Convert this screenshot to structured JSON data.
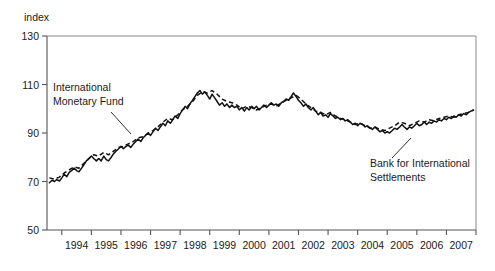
{
  "chart_data": {
    "type": "line",
    "title": "",
    "subtitle": "",
    "ylabel": "index",
    "xlabel": "",
    "ylim": [
      50,
      130
    ],
    "yticks": [
      50,
      70,
      90,
      110,
      130
    ],
    "ytick_labels": [
      "50",
      "70",
      "90",
      "110",
      "130"
    ],
    "xlim": [
      1993.5,
      2008.0
    ],
    "xticks": [
      1994,
      1995,
      1996,
      1997,
      1998,
      1999,
      2000,
      2001,
      2002,
      2003,
      2004,
      2005,
      2006,
      2007,
      2008
    ],
    "xtick_labels": [
      "1994",
      "1995",
      "1996",
      "1997",
      "1998",
      "1999",
      "2000",
      "2001",
      "2002",
      "2003",
      "2004",
      "2005",
      "2006",
      "2007"
    ],
    "grid": false,
    "legend_position": "inline-annotations",
    "annotations": [
      {
        "name": "imf-annotation",
        "lines": [
          "International",
          "Monetary Fund"
        ],
        "text_x": 53,
        "text_y": 91,
        "leader": {
          "x1": 111,
          "y1": 112,
          "x2": 131,
          "y2": 134
        }
      },
      {
        "name": "bis-annotation",
        "lines": [
          "Bank for International",
          "Settlements"
        ],
        "text_x": 370,
        "text_y": 167,
        "leader": {
          "x1": 392,
          "y1": 158,
          "x2": 411,
          "y2": 138
        }
      }
    ],
    "series": [
      {
        "name": "International Monetary Fund",
        "style": "dashed",
        "x": [
          1993.58,
          1993.75,
          1993.92,
          1994.08,
          1994.25,
          1994.42,
          1994.58,
          1994.75,
          1994.92,
          1995.08,
          1995.25,
          1995.42,
          1995.58,
          1995.75,
          1995.92,
          1996.08,
          1996.25,
          1996.42,
          1996.58,
          1996.75,
          1996.92,
          1997.08,
          1997.25,
          1997.42,
          1997.58,
          1997.75,
          1997.92,
          1998.08,
          1998.25,
          1998.42,
          1998.58,
          1998.75,
          1998.92,
          1999.08,
          1999.25,
          1999.42,
          1999.58,
          1999.75,
          1999.92,
          2000.08,
          2000.25,
          2000.42,
          2000.58,
          2000.75,
          2000.92,
          2001.08,
          2001.25,
          2001.42,
          2001.58,
          2001.75,
          2001.92,
          2002.08,
          2002.25,
          2002.42,
          2002.58,
          2002.75,
          2002.92,
          2003.08,
          2003.25,
          2003.42,
          2003.58,
          2003.75,
          2003.92,
          2004.08,
          2004.25,
          2004.42,
          2004.58,
          2004.75,
          2004.92,
          2005.08,
          2005.25,
          2005.42,
          2005.58,
          2005.75,
          2005.92,
          2006.08,
          2006.25,
          2006.42,
          2006.58,
          2006.75,
          2006.92,
          2007.08,
          2007.25,
          2007.42,
          2007.58,
          2007.75,
          2007.92
        ],
        "y": [
          71.5,
          71.0,
          71.8,
          73.5,
          74.8,
          76.0,
          75.5,
          77.5,
          79.5,
          81.0,
          80.5,
          82.0,
          81.0,
          82.5,
          84.0,
          84.5,
          85.5,
          86.5,
          88.0,
          88.5,
          90.0,
          91.0,
          92.5,
          94.5,
          96.0,
          95.5,
          97.5,
          99.5,
          101.0,
          103.0,
          105.5,
          107.0,
          106.5,
          107.5,
          106.0,
          104.0,
          103.0,
          102.5,
          101.5,
          100.0,
          101.0,
          100.5,
          99.5,
          100.5,
          101.5,
          102.0,
          101.0,
          102.5,
          103.5,
          104.5,
          105.5,
          104.0,
          102.0,
          100.5,
          99.0,
          98.5,
          97.5,
          98.5,
          97.0,
          96.0,
          95.5,
          94.5,
          93.5,
          94.0,
          93.0,
          92.0,
          92.5,
          91.5,
          91.0,
          92.0,
          93.0,
          94.5,
          94.0,
          93.0,
          94.0,
          95.0,
          94.5,
          95.5,
          95.0,
          96.0,
          96.5,
          97.0,
          96.5,
          97.5,
          98.0,
          98.5,
          99.5
        ]
      },
      {
        "name": "Bank for International Settlements",
        "style": "solid",
        "x": [
          1993.58,
          1993.67,
          1993.75,
          1993.83,
          1993.92,
          1994.0,
          1994.08,
          1994.17,
          1994.25,
          1994.33,
          1994.42,
          1994.5,
          1994.58,
          1994.67,
          1994.75,
          1994.83,
          1994.92,
          1995.0,
          1995.08,
          1995.17,
          1995.25,
          1995.33,
          1995.42,
          1995.5,
          1995.58,
          1995.67,
          1995.75,
          1995.83,
          1995.92,
          1996.0,
          1996.08,
          1996.17,
          1996.25,
          1996.33,
          1996.42,
          1996.5,
          1996.58,
          1996.67,
          1996.75,
          1996.83,
          1996.92,
          1997.0,
          1997.08,
          1997.17,
          1997.25,
          1997.33,
          1997.42,
          1997.5,
          1997.58,
          1997.67,
          1997.75,
          1997.83,
          1997.92,
          1998.0,
          1998.08,
          1998.17,
          1998.25,
          1998.33,
          1998.42,
          1998.5,
          1998.58,
          1998.67,
          1998.75,
          1998.83,
          1998.92,
          1999.0,
          1999.08,
          1999.17,
          1999.25,
          1999.33,
          1999.42,
          1999.5,
          1999.58,
          1999.67,
          1999.75,
          1999.83,
          1999.92,
          2000.0,
          2000.08,
          2000.17,
          2000.25,
          2000.33,
          2000.42,
          2000.5,
          2000.58,
          2000.67,
          2000.75,
          2000.83,
          2000.92,
          2001.0,
          2001.08,
          2001.17,
          2001.25,
          2001.33,
          2001.42,
          2001.5,
          2001.58,
          2001.67,
          2001.75,
          2001.83,
          2001.92,
          2002.0,
          2002.08,
          2002.17,
          2002.25,
          2002.33,
          2002.42,
          2002.5,
          2002.58,
          2002.67,
          2002.75,
          2002.83,
          2002.92,
          2003.0,
          2003.08,
          2003.17,
          2003.25,
          2003.33,
          2003.42,
          2003.5,
          2003.58,
          2003.67,
          2003.75,
          2003.83,
          2003.92,
          2004.0,
          2004.08,
          2004.17,
          2004.25,
          2004.33,
          2004.42,
          2004.5,
          2004.58,
          2004.67,
          2004.75,
          2004.83,
          2004.92,
          2005.0,
          2005.08,
          2005.17,
          2005.25,
          2005.33,
          2005.42,
          2005.5,
          2005.58,
          2005.67,
          2005.75,
          2005.83,
          2005.92,
          2006.0,
          2006.08,
          2006.17,
          2006.25,
          2006.33,
          2006.42,
          2006.5,
          2006.58,
          2006.67,
          2006.75,
          2006.83,
          2006.92,
          2007.0,
          2007.08,
          2007.17,
          2007.25,
          2007.33,
          2007.42,
          2007.5,
          2007.58,
          2007.67,
          2007.75,
          2007.83,
          2007.92
        ],
        "y": [
          69.5,
          70.5,
          70.0,
          70.8,
          70.2,
          71.5,
          73.0,
          72.0,
          73.8,
          74.5,
          75.5,
          74.5,
          74.0,
          75.5,
          77.0,
          78.5,
          79.5,
          80.5,
          79.5,
          78.5,
          79.5,
          78.5,
          80.5,
          79.0,
          78.5,
          80.0,
          81.5,
          82.5,
          83.5,
          84.5,
          83.5,
          84.5,
          85.0,
          84.0,
          85.5,
          86.5,
          87.5,
          86.5,
          88.0,
          89.0,
          90.0,
          89.0,
          90.5,
          92.0,
          91.0,
          92.5,
          94.0,
          93.0,
          95.0,
          94.0,
          95.5,
          97.0,
          96.0,
          98.0,
          99.5,
          101.0,
          100.0,
          102.0,
          103.5,
          105.0,
          106.5,
          107.5,
          106.0,
          107.0,
          105.5,
          104.0,
          106.0,
          104.5,
          103.0,
          101.5,
          102.5,
          101.0,
          102.0,
          100.5,
          101.5,
          100.5,
          101.0,
          99.5,
          100.5,
          99.0,
          100.5,
          99.5,
          101.0,
          100.0,
          101.0,
          99.5,
          100.5,
          101.5,
          100.5,
          101.5,
          102.5,
          101.5,
          102.0,
          101.0,
          102.5,
          103.0,
          104.0,
          103.5,
          105.0,
          106.5,
          105.0,
          103.5,
          102.5,
          101.0,
          102.0,
          100.5,
          99.5,
          100.5,
          99.0,
          97.5,
          98.5,
          97.0,
          97.5,
          96.5,
          98.0,
          97.0,
          96.0,
          96.5,
          95.5,
          96.0,
          95.0,
          95.5,
          94.5,
          93.5,
          94.0,
          93.0,
          94.0,
          93.5,
          92.5,
          93.0,
          92.0,
          91.5,
          92.5,
          91.5,
          90.5,
          91.0,
          90.0,
          90.5,
          90.0,
          91.0,
          92.0,
          91.5,
          92.5,
          93.5,
          92.5,
          91.5,
          92.5,
          92.0,
          93.0,
          94.0,
          93.0,
          93.5,
          94.5,
          93.5,
          94.5,
          94.0,
          95.0,
          94.5,
          95.5,
          95.0,
          96.0,
          95.5,
          96.5,
          96.0,
          97.0,
          96.5,
          97.5,
          97.0,
          98.0,
          97.5,
          98.5,
          99.0,
          99.5
        ]
      }
    ]
  },
  "colors": {
    "line": "#111111",
    "axis": "#555555",
    "frame": "#8a8a8a",
    "text": "#1a1a1a",
    "background": "#ffffff"
  }
}
